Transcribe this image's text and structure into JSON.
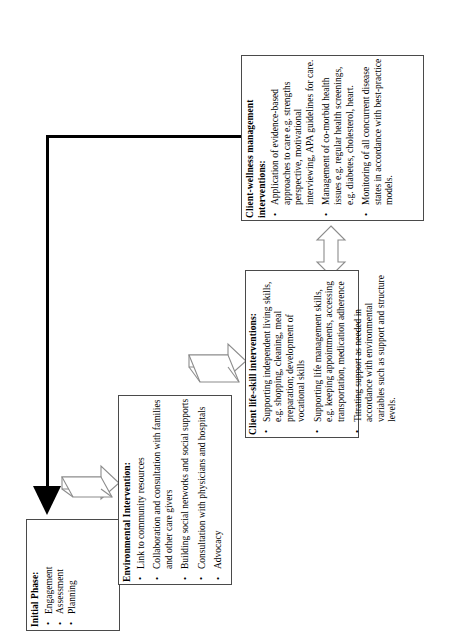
{
  "diagram": {
    "orientation": "rotated-90-ccw",
    "boxes": [
      {
        "id": "initial",
        "heading": "Initial Phase:",
        "bullets": [
          "Engagement",
          "Assessment",
          "Planning"
        ]
      },
      {
        "id": "environmental",
        "heading": "Environmental Intervention:",
        "bullets": [
          "Link to community resources",
          "Collaboration and consultation with families and other care givers",
          "Building social networks and social supports",
          "Consultation with physicians and hospitals",
          "Advocacy"
        ]
      },
      {
        "id": "lifeskill",
        "heading": "Client life-skill interventions:",
        "bullets": [
          "Supporting independent living skills, e.g. shopping, cleaning, meal preparation; development of vocational skills",
          "Supporting life management skills, e.g. keeping appointments, accessing transportation, medication adherence",
          "Titrating support as needed in accordance with environmental variables such as support and structure levels."
        ]
      },
      {
        "id": "wellness",
        "heading_line1": "Client-wellness management",
        "heading_line2": "interventions:",
        "bullets": [
          "Application of evidence-based approaches to care e.g. strengths perspective, motivational interviewing, APA guidelines for care.",
          "Management of co-morbid health issues e.g. regular health screenings, e.g. diabetes, cholesterol, heart.",
          "Monitoring of all concurrent disease states in accordance with best-practice models."
        ]
      }
    ],
    "connectors": [
      {
        "id": "feedback-elbow",
        "type": "thick-elbow-arrow",
        "from": "wellness",
        "to": "initial",
        "color": "#000000"
      },
      {
        "id": "initial-to-environmental",
        "type": "block-arrow-right",
        "from": "initial",
        "to": "environmental",
        "color": "#808080"
      },
      {
        "id": "environmental-to-lifeskill",
        "type": "block-arrow-right",
        "from": "environmental",
        "to": "lifeskill",
        "color": "#808080"
      },
      {
        "id": "lifeskill-to-wellness",
        "type": "block-arrow-double",
        "from": "lifeskill",
        "to": "wellness",
        "color": "#808080"
      }
    ],
    "colors": {
      "box_border": "#4a4a4a",
      "arrow_outline": "#808080",
      "thick_arrow": "#000000",
      "background": "#ffffff"
    }
  }
}
